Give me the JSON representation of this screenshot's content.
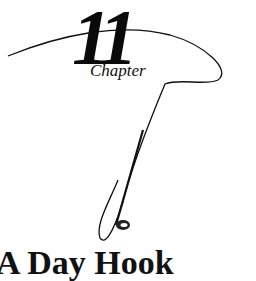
{
  "chapter": {
    "number": "11",
    "label": "Chapter",
    "title": "A Day Hook"
  }
}
